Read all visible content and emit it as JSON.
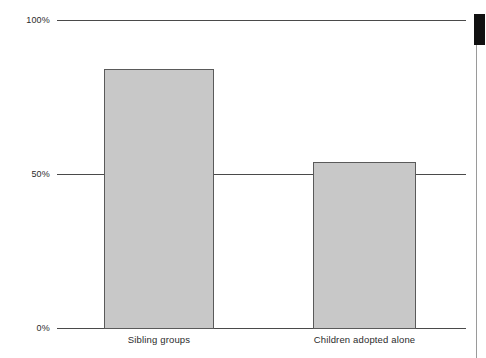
{
  "chart_data": {
    "type": "bar",
    "title": "",
    "subtitle": "",
    "xlabel": "",
    "ylabel": "",
    "categories": [
      "Sibling groups",
      "Children adopted alone"
    ],
    "values": [
      84,
      54
    ],
    "value_labels": [
      "",
      ""
    ],
    "series": [
      {
        "name": "",
        "values": [
          84,
          54
        ]
      }
    ],
    "ylim": [
      0,
      100
    ],
    "yticks": [
      0,
      50,
      100
    ],
    "ytick_labels": [
      "0%",
      "50%",
      "100%"
    ],
    "grid": true,
    "grid_axis": "y",
    "legend": false,
    "legend_position": "none",
    "annotations": [],
    "colors": {
      "bar_fill": "#c8c8c8",
      "bar_border": "#5a5a5a",
      "gridline": "#4a4a4a",
      "text": "#2b2b2b",
      "background": "#ffffff",
      "page_marker": "#111111"
    }
  },
  "axis": {
    "y": {
      "ticks": [
        {
          "label": "100%",
          "value": 100
        },
        {
          "label": "50%",
          "value": 50
        },
        {
          "label": "0%",
          "value": 0
        }
      ]
    },
    "x": {
      "ticks": [
        {
          "label": "Sibling groups"
        },
        {
          "label": "Children adopted alone"
        }
      ]
    }
  },
  "page": {
    "marker_name": "black-edge-marker",
    "rule_name": "page-edge-rule"
  }
}
